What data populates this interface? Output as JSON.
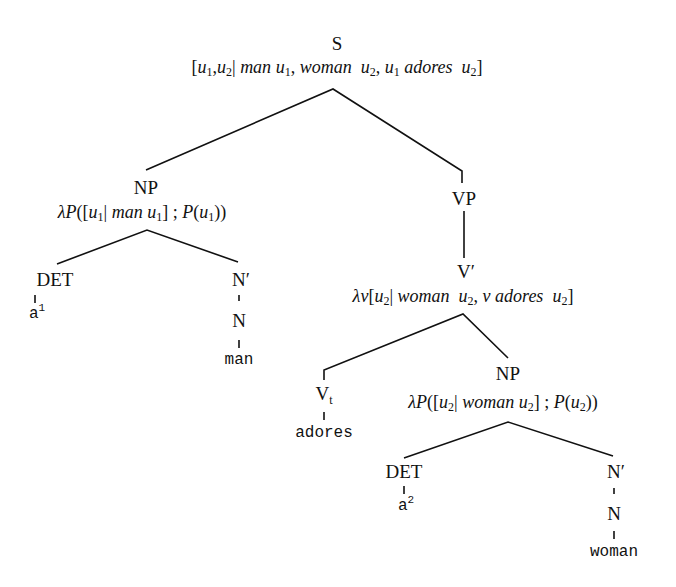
{
  "diagram": {
    "type": "syntax-tree",
    "root": {
      "label": "S",
      "formula": {
        "open": "[",
        "parts": [
          "u1,u2| man u1, woman u2, u1 adores u2"
        ],
        "text": "[u₁,u₂| man u₁, woman u₂, u₁ adores u₂]"
      }
    },
    "np1": {
      "label": "NP",
      "formula": "λP([u₁| man u₁] ; P(u₁))",
      "det": {
        "label": "DET",
        "word": "a",
        "index": "1"
      },
      "nbar": {
        "label": "N′",
        "n": "N",
        "word": "man"
      }
    },
    "vp": {
      "label": "VP",
      "vbar": {
        "label": "V′",
        "formula": "λv[u₂| woman u₂, v adores u₂]",
        "vt": {
          "label": "V",
          "sub": "t",
          "word": "adores"
        },
        "np2": {
          "label": "NP",
          "formula": "λP([u₂| woman u₂] ; P(u₂))",
          "det": {
            "label": "DET",
            "word": "a",
            "index": "2"
          },
          "nbar": {
            "label": "N′",
            "n": "N",
            "word": "woman"
          }
        }
      }
    },
    "t": {
      "s_lbr": "[",
      "u": "u",
      "one": "1",
      "two": "2",
      "comma": ",",
      "bar": "|",
      "man": "man",
      "woman": "woman",
      "adores": "adores",
      "rbr": "]",
      "lambda_P": "λP",
      "lambda_v": "λv",
      "v": "v",
      "P": "P",
      "semi": " ; ",
      "lp": "(",
      "rp": ")",
      "lb": "[",
      "rb": "]",
      "sp": " "
    }
  }
}
